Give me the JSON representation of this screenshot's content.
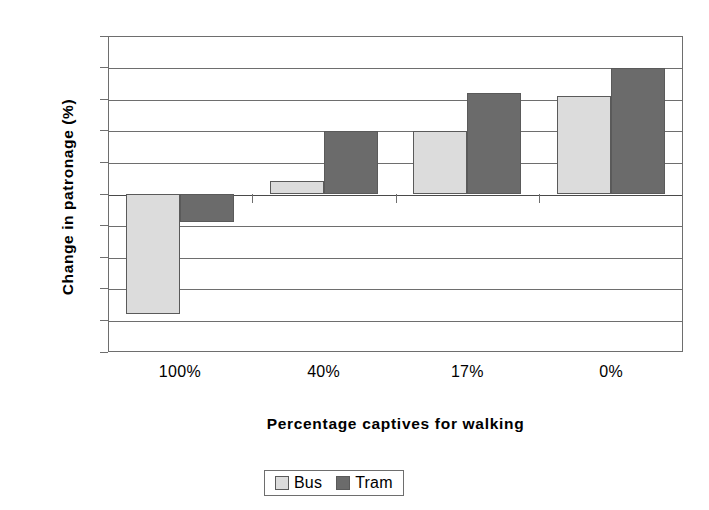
{
  "chart_data": {
    "type": "bar",
    "title": "",
    "xlabel": "Percentage captives for walking",
    "ylabel": "Change in patronage (%)",
    "categories": [
      "100%",
      "40%",
      "17%",
      "0%"
    ],
    "series": [
      {
        "name": "Bus",
        "color": "#dcdcdc",
        "values": [
          -3.8,
          0.4,
          2.0,
          3.1
        ]
      },
      {
        "name": "Tram",
        "color": "#6b6b6b",
        "values": [
          -0.9,
          2.0,
          3.2,
          4.0
        ]
      }
    ],
    "ylim": [
      -5,
      5
    ],
    "yticks": [
      5,
      4,
      3,
      2,
      1,
      0,
      -1,
      -2,
      -3,
      -4,
      -5
    ],
    "ytick_labels": [
      "5",
      "4",
      "3",
      "2",
      "1",
      "0",
      "-1",
      "-2",
      "-3",
      "-4",
      "-5"
    ],
    "grid": true,
    "grid_axis": "y",
    "legend_position": "bottom-center",
    "legend_entries": [
      "Bus",
      "Tram"
    ]
  }
}
